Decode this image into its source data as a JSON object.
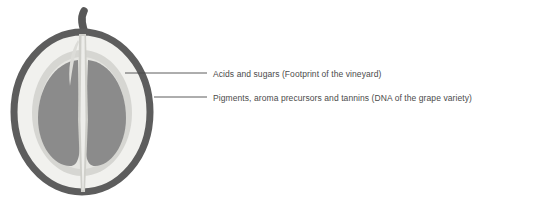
{
  "diagram": {
    "parts": [
      {
        "id": "stem",
        "name": "stem",
        "color": "#585858"
      },
      {
        "id": "skin",
        "name": "skin",
        "color": "#5d5d5d"
      },
      {
        "id": "pulp-outer",
        "name": "outer pulp",
        "color": "#f1f1ee"
      },
      {
        "id": "pulp-inner",
        "name": "inner pulp",
        "color": "#d6d6d2"
      },
      {
        "id": "seed-left",
        "name": "left seed",
        "color": "#8b8b8b"
      },
      {
        "id": "seed-right",
        "name": "right seed",
        "color": "#8b8b8b"
      },
      {
        "id": "core",
        "name": "central core",
        "color": "#c9c9c4"
      }
    ]
  },
  "callouts": [
    {
      "id": "acids",
      "label": "Acids and sugars (Footprint of the vineyard)",
      "target": "pulp-outer",
      "line": {
        "x1": 125,
        "y1": 73,
        "x2": 207,
        "y2": 73
      }
    },
    {
      "id": "pigments",
      "label": "Pigments, aroma precursors and tannins (DNA of the grape variety)",
      "target": "skin",
      "line": {
        "x1": 154,
        "y1": 97,
        "x2": 207,
        "y2": 97
      }
    }
  ],
  "colors": {
    "background": "#ffffff",
    "text": "#4b4b4b",
    "leader_line": "#4b4b4b",
    "skin": "#5d5d5d",
    "pulp_outer": "#f1f1ee",
    "pulp_inner": "#d6d6d2",
    "seed": "#8b8b8b",
    "core": "#c9c9c4",
    "stem": "#585858"
  }
}
